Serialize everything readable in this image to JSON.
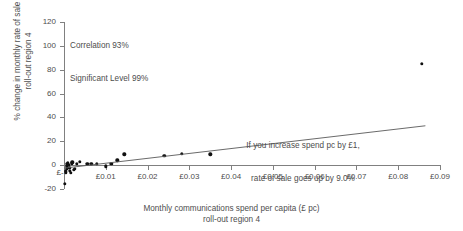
{
  "chart_data": {
    "type": "scatter",
    "title": "",
    "xlabel": "Monthly communications spend per capita (£ pc)",
    "xlabel_line2": "roll-out region 4",
    "ylabel": "% change in monthly rate of sale",
    "ylabel_line2": "roll-out region 4",
    "xlim": [
      0,
      0.09
    ],
    "ylim": [
      -20,
      120
    ],
    "grid": false,
    "legend": "none",
    "x_ticks": [
      0,
      0.01,
      0.02,
      0.03,
      0.04,
      0.05,
      0.06,
      0.07,
      0.08,
      0.09
    ],
    "x_tick_labels": [
      "£-",
      "£0.01",
      "£0.02",
      "£0.03",
      "£0.04",
      "£0.05",
      "£0.06",
      "£0.07",
      "£0.08",
      "£0.09"
    ],
    "y_ticks": [
      -20,
      0,
      20,
      40,
      60,
      80,
      100,
      120
    ],
    "y_tick_labels": [
      "-20",
      "0",
      "20",
      "40",
      "60",
      "80",
      "100",
      "120"
    ],
    "points": [
      {
        "x": 0.0002,
        "y": -15.5
      },
      {
        "x": 0.0004,
        "y": -6.0
      },
      {
        "x": 0.0005,
        "y": -4.5
      },
      {
        "x": 0.0006,
        "y": -3.0
      },
      {
        "x": 0.0007,
        "y": -1.0
      },
      {
        "x": 0.0008,
        "y": 1.0
      },
      {
        "x": 0.0009,
        "y": 2.0
      },
      {
        "x": 0.0011,
        "y": 0.5
      },
      {
        "x": 0.0013,
        "y": -2.0
      },
      {
        "x": 0.0014,
        "y": -5.0
      },
      {
        "x": 0.0016,
        "y": -6.5
      },
      {
        "x": 0.0018,
        "y": 1.5
      },
      {
        "x": 0.002,
        "y": 2.5
      },
      {
        "x": 0.0023,
        "y": -4.0
      },
      {
        "x": 0.0026,
        "y": -3.0
      },
      {
        "x": 0.003,
        "y": 1.0
      },
      {
        "x": 0.0038,
        "y": 3.0
      },
      {
        "x": 0.0056,
        "y": 1.0
      },
      {
        "x": 0.0065,
        "y": 1.0
      },
      {
        "x": 0.0078,
        "y": 1.0
      },
      {
        "x": 0.01,
        "y": -1.0
      },
      {
        "x": 0.0113,
        "y": 1.0
      },
      {
        "x": 0.0128,
        "y": 4.0
      },
      {
        "x": 0.0144,
        "y": 9.0
      },
      {
        "x": 0.024,
        "y": 8.0
      },
      {
        "x": 0.0282,
        "y": 9.5
      },
      {
        "x": 0.035,
        "y": 9.0
      },
      {
        "x": 0.0856,
        "y": 85.0
      }
    ],
    "trend_line": {
      "x_start": 0.0,
      "y_start": -2.5,
      "x_end": 0.0865,
      "y_end": 33.0,
      "slope_percent_per_pound": 9.0
    },
    "annotations": {
      "stats_line1": "Correlation 93%",
      "stats_line2": "Significant Level 99%",
      "slope_line1": "If you increase spend pc by £1,",
      "slope_line2": "rate of sale goes up by 9.0%"
    },
    "colors": {
      "point": "#111111",
      "trend": "#595959",
      "axis": "#808080",
      "text": "#4d4d4d",
      "background": "#ffffff"
    }
  }
}
